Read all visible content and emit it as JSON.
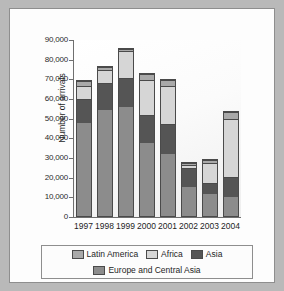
{
  "chart_data": {
    "type": "bar",
    "stacked": true,
    "title": "",
    "xlabel": "",
    "ylabel": "Number of arrivals",
    "ylim": [
      0,
      90000
    ],
    "ytick_labels": [
      "90,000",
      "80,000",
      "70,000",
      "60,000",
      "50,000",
      "40,000",
      "30,000",
      "20,000",
      "10,000",
      "0"
    ],
    "ytick_values": [
      90000,
      80000,
      70000,
      60000,
      50000,
      40000,
      30000,
      20000,
      10000,
      0
    ],
    "grid": false,
    "legend_position": "bottom",
    "categories": [
      "1997",
      "1998",
      "1999",
      "2000",
      "2001",
      "2002",
      "2003",
      "2004"
    ],
    "series": [
      {
        "name": "Europe and Central Asia",
        "color": "#8c8c8c",
        "values": [
          47500,
          54000,
          55500,
          37000,
          31500,
          15000,
          11000,
          9500
        ]
      },
      {
        "name": "Asia",
        "color": "#555555",
        "values": [
          12000,
          13500,
          14500,
          14500,
          15500,
          9500,
          6000,
          10500
        ]
      },
      {
        "name": "Africa",
        "color": "#d6d6d6",
        "values": [
          6500,
          7000,
          14000,
          17500,
          19000,
          1500,
          10000,
          29500
        ]
      },
      {
        "name": "Latin America",
        "color": "#a9a9a9",
        "values": [
          2500,
          1500,
          1000,
          3000,
          3000,
          1000,
          1500,
          3500
        ]
      }
    ],
    "totals": [
      68500,
      76000,
      85000,
      72000,
      69000,
      27000,
      28500,
      53000
    ]
  },
  "legend": {
    "rows": [
      [
        {
          "label": "Latin America",
          "color": "#a9a9a9"
        },
        {
          "label": "Africa",
          "color": "#d6d6d6"
        },
        {
          "label": "Asia",
          "color": "#555555"
        }
      ],
      [
        {
          "label": "Europe and Central Asia",
          "color": "#8c8c8c"
        }
      ]
    ]
  }
}
